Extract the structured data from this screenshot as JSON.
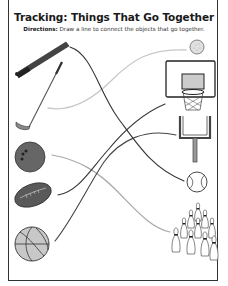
{
  "worksheet": {
    "title": "Tracking: Things That Go Together",
    "directions_label": "Directions:",
    "directions_text": " Draw a line to connect the objects that go together."
  },
  "left_objects": [
    {
      "id": "baseball-bat",
      "label": "baseball bat"
    },
    {
      "id": "golf-club",
      "label": "golf club"
    },
    {
      "id": "bowling-ball",
      "label": "bowling ball"
    },
    {
      "id": "football",
      "label": "football"
    },
    {
      "id": "basketball",
      "label": "basketball"
    }
  ],
  "right_objects": [
    {
      "id": "golf-ball",
      "label": "golf ball"
    },
    {
      "id": "basketball-hoop",
      "label": "basketball hoop"
    },
    {
      "id": "goalpost",
      "label": "football goalpost"
    },
    {
      "id": "baseball",
      "label": "baseball"
    },
    {
      "id": "bowling-pins",
      "label": "bowling pins"
    }
  ],
  "connections": [
    {
      "from": "baseball-bat",
      "to": "baseball",
      "stroke": "#333333"
    },
    {
      "from": "golf-club",
      "to": "golf-ball",
      "stroke": "#c8c8c8"
    },
    {
      "from": "bowling-ball",
      "to": "bowling-pins",
      "stroke": "#a8a8a8"
    },
    {
      "from": "football",
      "to": "basketball-hoop",
      "stroke": "#333333"
    },
    {
      "from": "basketball",
      "to": "goalpost",
      "stroke": "#444444"
    }
  ],
  "colors": {
    "frame": "#333333",
    "dark_object": "#555555",
    "light_fill": "#c8c8c8"
  }
}
